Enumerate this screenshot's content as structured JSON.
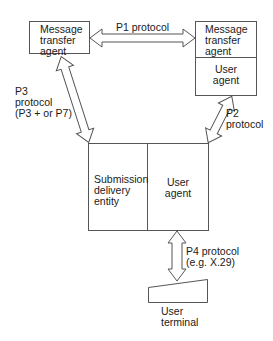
{
  "boxes": {
    "mta_left": {
      "line1": "Message",
      "line2": "transfer",
      "line3": "agent"
    },
    "mta_right": {
      "line1": "Message",
      "line2": "transfer",
      "line3": "agent"
    },
    "ua_right": {
      "line1": "User",
      "line2": "agent"
    },
    "sde": {
      "line1": "Submission",
      "line2": "delivery",
      "line3": "entity"
    },
    "ua_center": {
      "line1": "User",
      "line2": "agent"
    },
    "terminal": {
      "line1": "User",
      "line2": "terminal"
    }
  },
  "protocols": {
    "p1": {
      "line1": "P1 protocol"
    },
    "p2": {
      "line1": "P2",
      "line2": "protocol"
    },
    "p3": {
      "line1": "P3",
      "line2": "protocol",
      "line3": "(P3 +  or P7)"
    },
    "p4": {
      "line1": "P4 protocol",
      "line2": "(e.g. X.29)"
    }
  },
  "colors": {
    "stroke": "#555555",
    "text": "#1a1a1a"
  }
}
